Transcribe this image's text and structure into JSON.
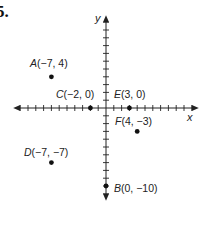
{
  "problem": {
    "number": "5."
  },
  "plane": {
    "origin_px": [
      106,
      108
    ],
    "unit_px": 7.8,
    "x_range": [
      -11,
      11
    ],
    "y_range": [
      -11,
      11
    ],
    "x_label": "x",
    "y_label": "y",
    "axis_color": "#222222"
  },
  "chart_data": {
    "type": "scatter",
    "title": "",
    "xlabel": "x",
    "ylabel": "y",
    "xlim": [
      -11,
      11
    ],
    "ylim": [
      -11,
      11
    ],
    "grid": false,
    "ticks_every": 1,
    "points": [
      {
        "name": "A",
        "label": "A(−7, 4)",
        "x": -7,
        "y": 4
      },
      {
        "name": "B",
        "label": "B(0, −10)",
        "x": 0,
        "y": -10
      },
      {
        "name": "C",
        "label": "C(−2, 0)",
        "x": -2,
        "y": 0
      },
      {
        "name": "D",
        "label": "D(−7, −7)",
        "x": -7,
        "y": -7
      },
      {
        "name": "E",
        "label": "E(3, 0)",
        "x": 3,
        "y": 0
      },
      {
        "name": "F",
        "label": "F(4, −3)",
        "x": 4,
        "y": -3
      }
    ]
  },
  "labels": {
    "A": {
      "letter": "A",
      "coords": "(−7, 4)"
    },
    "B": {
      "letter": "B",
      "coords": "(0, −10)"
    },
    "C": {
      "letter": "C",
      "coords": "(−2, 0)"
    },
    "D": {
      "letter": "D",
      "coords": "(−7, −7)"
    },
    "E": {
      "letter": "E",
      "coords": "(3, 0)"
    },
    "F": {
      "letter": "F",
      "coords": "(4, −3)"
    }
  }
}
